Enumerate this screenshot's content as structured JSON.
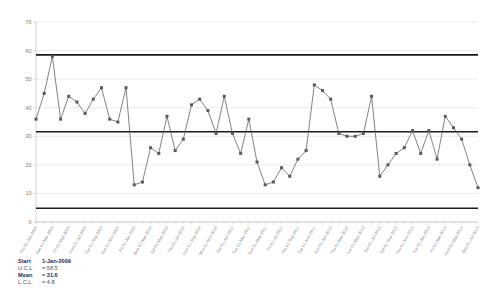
{
  "chart_data": {
    "type": "line",
    "title": "",
    "xlabel": "",
    "ylabel": "",
    "ylim": [
      0,
      70
    ],
    "yticks": [
      0,
      10,
      20,
      30,
      40,
      50,
      60,
      70
    ],
    "grid": true,
    "legend_position": "below-left",
    "control_limits": {
      "ucl": 58.5,
      "mean": 31.6,
      "lcl": 4.8
    },
    "x": [
      "Thu 01-Jan-2009",
      "Sun 01-Feb-2009",
      "Sun 01-Mar-2009",
      "Wed 01-Apr-2009",
      "Fri 01-May-2009",
      "Mon 01-Jun-2009",
      "Wed 01-Jul-2009",
      "Sat 01-Aug-2009",
      "Tue 01-Sep-2009",
      "Thu 01-Oct-2009",
      "Sun 01-Nov-2009",
      "Tue 01-Dec-2009",
      "Fri 01-Jan-2010",
      "Mon 01-Feb-2010",
      "Mon 01-Mar-2010",
      "Thu 01-Apr-2010",
      "Sat 01-May-2010",
      "Tue 01-Jun-2010",
      "Thu 01-Jul-2010",
      "Sun 01-Aug-2010",
      "Wed 01-Sep-2010",
      "Fri 01-Oct-2010",
      "Mon 01-Nov-2010",
      "Wed 01-Dec-2010",
      "Sat 01-Jan-2011",
      "Tue 01-Feb-2011",
      "Tue 01-Mar-2011",
      "Fri 01-Apr-2011",
      "Sun 01-May-2011",
      "Wed 01-Jun-2011",
      "Fri 01-Jul-2011",
      "Mon 01-Aug-2011",
      "Thu 01-Sep-2011",
      "Sat 01-Oct-2011",
      "Tue 01-Nov-2011",
      "Thu 01-Dec-2011",
      "Sun 01-Jan-2012",
      "Wed 01-Feb-2012",
      "Thu 01-Mar-2012",
      "Sun 01-Apr-2012",
      "Tue 01-May-2012",
      "Fri 01-Jun-2012",
      "Sun 01-Jul-2012",
      "Wed 01-Aug-2012",
      "Sat 01-Sep-2012",
      "Mon 01-Oct-2012",
      "Thu 01-Nov-2012",
      "Sat 01-Dec-2012",
      "Tue 01-Jan-2013",
      "Fri 01-Feb-2013",
      "Fri 01-Mar-2013",
      "Mon 01-Apr-2013",
      "Wed 01-May-2013",
      "Sat 01-Jun-2013",
      "Mon 01-Jul-2013"
    ],
    "values": [
      36,
      45,
      58,
      36,
      44,
      42,
      38,
      43,
      47,
      36,
      35,
      47,
      13,
      14,
      26,
      24,
      37,
      25,
      29,
      41,
      43,
      39,
      31,
      44,
      31,
      24,
      36,
      21,
      13,
      14,
      19,
      16,
      22,
      25,
      48,
      46,
      43,
      31,
      30,
      30,
      31,
      44,
      16,
      20,
      24,
      26,
      32,
      24,
      32,
      22,
      37,
      33,
      29,
      20,
      12
    ],
    "series_name": "Individuals",
    "marker": "square",
    "series_color": "#595959",
    "limit_line_color": "#1a1a1a"
  },
  "legend": {
    "rows": [
      {
        "key": "Start",
        "value": "1-Jan-2009",
        "bold": true
      },
      {
        "key": "U.C.L",
        "value": "= 58.5",
        "bold": false
      },
      {
        "key": "Mean",
        "value": "= 31.6",
        "bold": true
      },
      {
        "key": "L.C.L.",
        "value": "= 4.8",
        "bold": false
      }
    ]
  }
}
